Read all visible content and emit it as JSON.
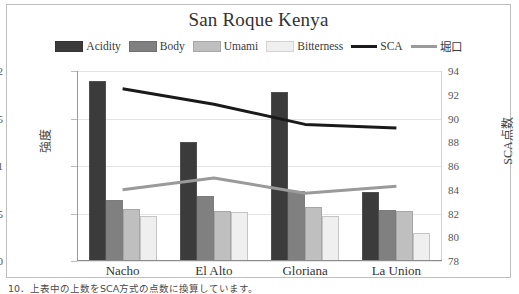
{
  "chart_data": {
    "type": "bar",
    "title": "San Roque Kenya",
    "categories": [
      "Nacho",
      "El Alto",
      "Gloriana",
      "La Union"
    ],
    "xlabel": "",
    "ylabel": "強度",
    "ylabel_secondary": "SCA点数",
    "ylim": [
      0,
      2
    ],
    "ylim_secondary": [
      78,
      94
    ],
    "yticks": [
      "0",
      "0.5",
      "1",
      "1.5",
      "2"
    ],
    "ytick_values": [
      0,
      0.5,
      1,
      1.5,
      2
    ],
    "yticks_secondary": [
      "78",
      "80",
      "82",
      "84",
      "86",
      "88",
      "90",
      "92",
      "94"
    ],
    "ytick_values_secondary": [
      78,
      80,
      82,
      84,
      86,
      88,
      90,
      92,
      94
    ],
    "grid": true,
    "legend_position": "top",
    "series": [
      {
        "name": "Acidity",
        "kind": "bar",
        "axis": "left",
        "color": "#3b3b3b",
        "values": [
          1.9,
          1.25,
          1.78,
          0.73
        ]
      },
      {
        "name": "Body",
        "kind": "bar",
        "axis": "left",
        "color": "#808080",
        "values": [
          0.64,
          0.68,
          0.74,
          0.54
        ]
      },
      {
        "name": "Umami",
        "kind": "bar",
        "axis": "left",
        "color": "#bfbfbf",
        "values": [
          0.55,
          0.53,
          0.57,
          0.53
        ]
      },
      {
        "name": "Bitterness",
        "kind": "bar",
        "axis": "left",
        "color": "#efefef",
        "values": [
          0.47,
          0.52,
          0.47,
          0.3
        ]
      },
      {
        "name": "SCA",
        "kind": "line",
        "axis": "right",
        "color": "#1a1a1a",
        "values": [
          92.5,
          91.2,
          89.5,
          89.2
        ]
      },
      {
        "name": "堀口",
        "kind": "line",
        "axis": "right",
        "color": "#9a9a9a",
        "values": [
          84.0,
          85.0,
          83.7,
          84.3
        ]
      }
    ]
  },
  "caption": {
    "text": "10．上表中の上数をSCA方式の点数に換算しています。"
  }
}
